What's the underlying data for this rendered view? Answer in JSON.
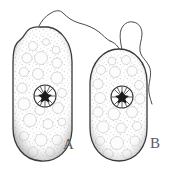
{
  "figure": {
    "kind": "scientific-line-illustration",
    "background_color": "#ffffff",
    "outline_color": "#3a3a3a",
    "stipple_color": "#b9b9b9",
    "vacuole_fill": "#fbfbfb",
    "nucleus_core_color": "#1d1d1d",
    "label_color": "#5a5a5a",
    "labels": [
      {
        "id": "a",
        "text": "A"
      },
      {
        "id": "b",
        "text": "B"
      }
    ],
    "cells": [
      {
        "id": "a",
        "label": "A",
        "description": "left cell, broad elongated oval tilted slightly, notched double bump at upper left",
        "bounds": {
          "x": 13,
          "y": 26,
          "width": 60,
          "height": 136
        },
        "nucleus": {
          "cx": 45,
          "cy": 96,
          "r": 11,
          "spokes": 10
        },
        "flagella_count": 1
      },
      {
        "id": "b",
        "label": "B",
        "description": "right cell, narrower elongated oval, rounded apex and base",
        "bounds": {
          "x": 89,
          "y": 48,
          "width": 59,
          "height": 114
        },
        "nucleus": {
          "cx": 122,
          "cy": 97,
          "r": 11,
          "spokes": 10
        },
        "flagella_count": 2
      }
    ],
    "flagella": [
      {
        "id": "flagellum-a",
        "origin_cell": "a",
        "description": "long wavy filament from apex of cell A curving up and to the right"
      },
      {
        "id": "flagellum-b-left",
        "origin_cell": "b",
        "description": "flagellum from apex of cell B curving up and to the left, meeting the wavy filament"
      },
      {
        "id": "flagellum-b-right",
        "origin_cell": "b",
        "description": "flagellum from apex of cell B looping up and waving down the right side"
      }
    ]
  }
}
